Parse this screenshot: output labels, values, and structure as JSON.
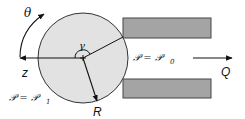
{
  "diagram": {
    "type": "roller-channel-flow",
    "colors": {
      "circle_fill": "#e2e2e2",
      "circle_stroke": "#333333",
      "wall_fill": "#a4a4a4",
      "wall_stroke": "#444444",
      "line": "#111111"
    },
    "labels": {
      "theta": "θ",
      "gamma": "γ",
      "z": "z",
      "R": "R",
      "Q": "Q",
      "pressure_inlet": "𝒫 = 𝒫",
      "pressure_inlet_sub": "1",
      "pressure_outlet": "𝒫 = 𝒫",
      "pressure_outlet_sub": "0"
    }
  }
}
